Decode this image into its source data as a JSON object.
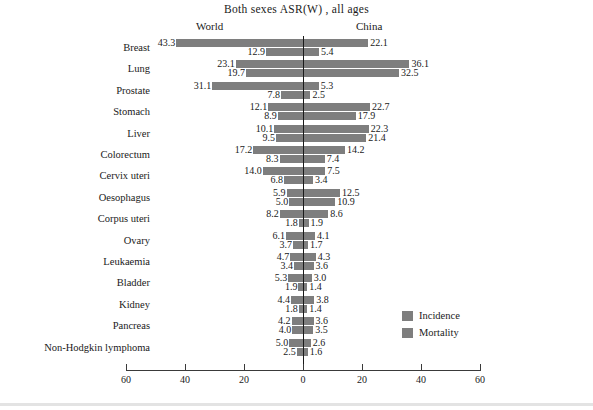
{
  "chart_data": {
    "type": "bar",
    "title": "Both sexes ASR(W) , all ages",
    "subtype": "diverging-bar",
    "left_panel_label": "World",
    "right_panel_label": "China",
    "xlabel": "",
    "ylabel": "",
    "xlim": [
      60,
      60
    ],
    "ticks": [
      60,
      40,
      20,
      0,
      20,
      40,
      60
    ],
    "tick_labels": [
      "60",
      "40",
      "20",
      "0",
      "20",
      "40",
      "60"
    ],
    "grid": false,
    "legend_position": "bottom-right",
    "legend": [
      {
        "name": "Incidence",
        "color": "#7e7e7e"
      },
      {
        "name": "Mortality",
        "color": "#7e7e7e"
      }
    ],
    "categories": [
      "Breast",
      "Lung",
      "Prostate",
      "Stomach",
      "Liver",
      "Colorectum",
      "Cervix uteri",
      "Oesophagus",
      "Corpus uteri",
      "Ovary",
      "Leukaemia",
      "Bladder",
      "Kidney",
      "Pancreas",
      "Non-Hodgkin lymphoma"
    ],
    "series": [
      {
        "name": "World Incidence",
        "side": "left",
        "metric": "Incidence",
        "values": [
          43.3,
          23.1,
          31.1,
          12.1,
          10.1,
          17.2,
          14.0,
          5.9,
          8.2,
          6.1,
          4.7,
          5.3,
          4.4,
          4.2,
          5.0
        ]
      },
      {
        "name": "World Mortality",
        "side": "left",
        "metric": "Mortality",
        "values": [
          12.9,
          19.7,
          7.8,
          8.9,
          9.5,
          8.3,
          6.8,
          5.0,
          1.8,
          3.7,
          3.4,
          1.9,
          1.8,
          4.0,
          2.5
        ]
      },
      {
        "name": "China Incidence",
        "side": "right",
        "metric": "Incidence",
        "values": [
          22.1,
          36.1,
          5.3,
          22.7,
          22.3,
          14.2,
          7.5,
          12.5,
          8.6,
          4.1,
          4.3,
          3.0,
          3.8,
          3.6,
          2.6
        ]
      },
      {
        "name": "China Mortality",
        "side": "right",
        "metric": "Mortality",
        "values": [
          5.4,
          32.5,
          2.5,
          17.9,
          21.4,
          7.4,
          3.4,
          10.9,
          1.9,
          1.7,
          3.6,
          1.4,
          1.4,
          3.5,
          1.6
        ]
      }
    ]
  },
  "colors": {
    "bar": "#7e7e7e",
    "axis": "#1a1a1a",
    "text": "#1a1a1a",
    "background": "#ffffff"
  }
}
